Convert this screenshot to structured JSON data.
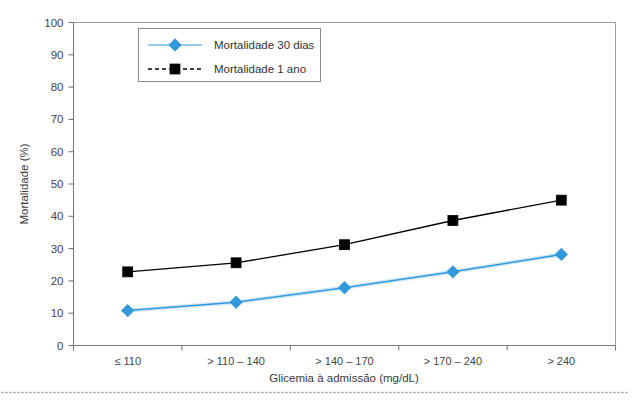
{
  "chart_data": {
    "type": "line",
    "title": "",
    "xlabel": "Glicemia à admissão (mg/dL)",
    "ylabel": "Mortalidade (%)",
    "categories": [
      "≤ 110",
      "> 110 – 140",
      "> 140 – 170",
      "> 170 – 240",
      "> 240"
    ],
    "ylim": [
      0,
      100
    ],
    "ytick_step": 10,
    "yticks": [
      "0",
      "10",
      "20",
      "30",
      "40",
      "50",
      "60",
      "70",
      "80",
      "90",
      "100"
    ],
    "grid": false,
    "legend_position": "top-left-inside",
    "series": [
      {
        "name": "Mortalidade 30 dias",
        "values": [
          10.8,
          13.4,
          17.9,
          22.8,
          28.2
        ],
        "color": "#3399DD",
        "marker": "diamond",
        "line_style": "solid"
      },
      {
        "name": "Mortalidade 1 ano",
        "values": [
          22.8,
          25.6,
          31.2,
          38.7,
          45.0
        ],
        "color": "#000000",
        "marker": "square",
        "line_style": "solid"
      }
    ]
  },
  "legend": {
    "entries": [
      {
        "label": "Mortalidade 30 dias",
        "marker": "diamond",
        "color": "#3399DD",
        "dash": "solid"
      },
      {
        "label": "Mortalidade 1 ano",
        "marker": "square",
        "color": "#000000",
        "dash": "dashed"
      }
    ]
  },
  "colors": {
    "series_30_dias": "#3399DD",
    "series_1_ano": "#000000",
    "frame": "#9a9a9a",
    "axis": "#7a7a7a",
    "text": "#3a3a3a",
    "background": "#ffffff"
  }
}
